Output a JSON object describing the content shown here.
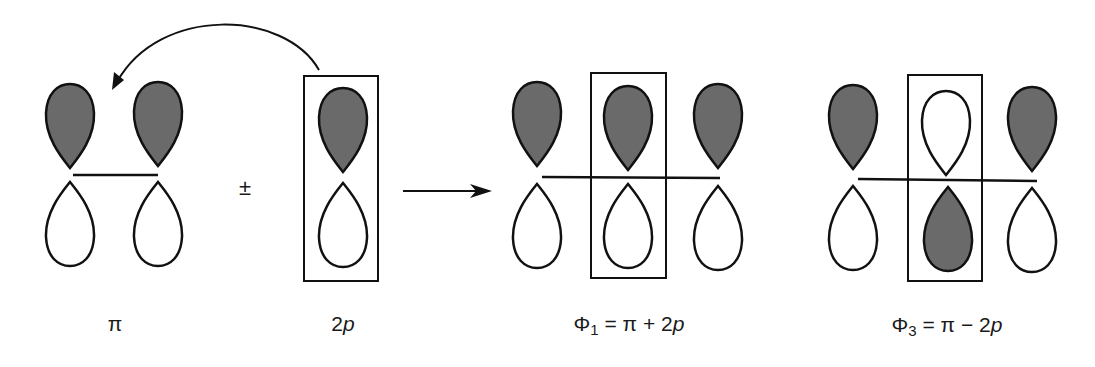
{
  "colors": {
    "shaded_lobe": "#6a6a6a",
    "outline": "#111111",
    "background": "#ffffff"
  },
  "operators": {
    "plus_minus": "±"
  },
  "panels": [
    {
      "id": "pi",
      "label": {
        "main": "π",
        "sub": "",
        "rest": ""
      },
      "orbitals": [
        {
          "x": 70,
          "top": "shaded",
          "bottom": "empty"
        },
        {
          "x": 158,
          "top": "shaded",
          "bottom": "empty"
        }
      ],
      "boxed": false
    },
    {
      "id": "2p",
      "label": {
        "main": "2",
        "italic": "p"
      },
      "orbitals": [
        {
          "x": 343,
          "top": "shaded",
          "bottom": "empty"
        }
      ],
      "boxed": true
    },
    {
      "id": "phi1",
      "label": {
        "symbol": "Φ",
        "sub": "1",
        "rest": " = π + 2",
        "italic": "p"
      },
      "orbitals": [
        {
          "x": 537,
          "top": "shaded",
          "bottom": "empty"
        },
        {
          "x": 630,
          "top": "shaded",
          "bottom": "empty"
        },
        {
          "x": 719,
          "top": "shaded",
          "bottom": "empty"
        }
      ],
      "boxed": true
    },
    {
      "id": "phi3",
      "label": {
        "symbol": "Φ",
        "sub": "3",
        "rest": " = π − 2",
        "italic": "p"
      },
      "orbitals": [
        {
          "x": 853,
          "top": "shaded",
          "bottom": "empty"
        },
        {
          "x": 946,
          "top": "empty",
          "bottom": "shaded"
        },
        {
          "x": 1032,
          "top": "shaded",
          "bottom": "empty"
        }
      ],
      "boxed": true
    }
  ]
}
